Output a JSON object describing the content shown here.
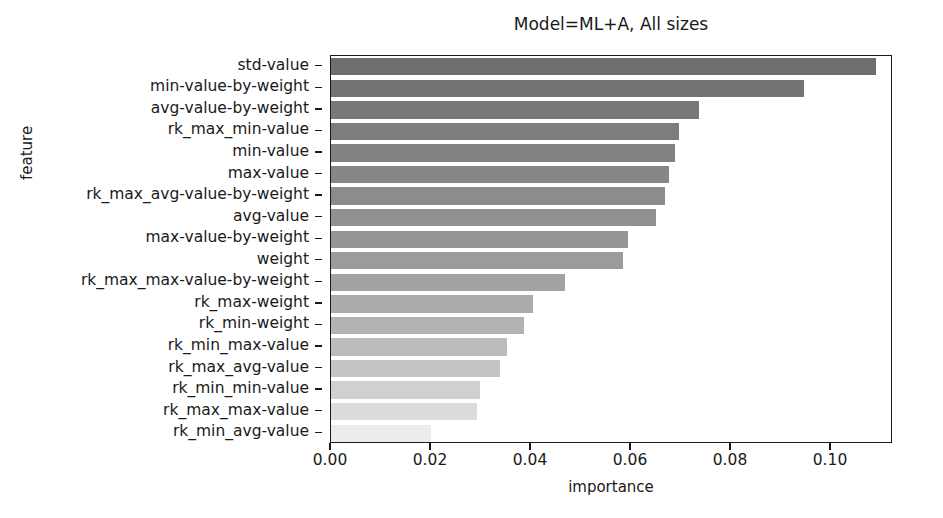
{
  "chart_data": {
    "type": "bar",
    "orientation": "horizontal",
    "title": "Model=ML+A, All sizes",
    "xlabel": "importance",
    "ylabel": "feature",
    "xlim": [
      0.0,
      0.1124
    ],
    "grid": false,
    "legend": null,
    "xticks": [
      "0.00",
      "0.02",
      "0.04",
      "0.06",
      "0.08",
      "0.10"
    ],
    "xtick_values": [
      0.0,
      0.02,
      0.04,
      0.06,
      0.08,
      0.1
    ],
    "categories": [
      "std-value",
      "min-value-by-weight",
      "avg-value-by-weight",
      "rk_max_min-value",
      "min-value",
      "max-value",
      "rk_max_avg-value-by-weight",
      "avg-value",
      "max-value-by-weight",
      "weight",
      "rk_max_max-value-by-weight",
      "rk_max-weight",
      "rk_min-weight",
      "rk_min_max-value",
      "rk_max_avg-value",
      "rk_min_min-value",
      "rk_max_max-value",
      "rk_min_avg-value"
    ],
    "values": [
      0.109,
      0.0945,
      0.0735,
      0.0695,
      0.0688,
      0.0675,
      0.0668,
      0.065,
      0.0594,
      0.0583,
      0.0468,
      0.0404,
      0.0386,
      0.0352,
      0.0338,
      0.0298,
      0.0292,
      0.02
    ],
    "bar_colors": [
      "#6e6e6e",
      "#737373",
      "#787878",
      "#7d7d7d",
      "#828282",
      "#878787",
      "#8c8c8c",
      "#919191",
      "#969696",
      "#9b9b9b",
      "#a3a3a3",
      "#ababab",
      "#b3b3b3",
      "#bcbcbc",
      "#c4c4c4",
      "#d0d0d0",
      "#dcdcdc",
      "#ececec"
    ]
  }
}
